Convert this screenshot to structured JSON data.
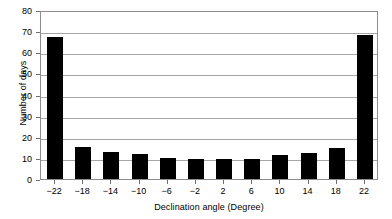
{
  "chart_data": {
    "type": "bar",
    "title": "",
    "subtitle": "",
    "xlabel": "Declination angle (Degree)",
    "ylabel": "Number of days",
    "categories": [
      "−22",
      "−18",
      "−14",
      "−10",
      "−6",
      "−2",
      "2",
      "6",
      "10",
      "14",
      "18",
      "22"
    ],
    "values": [
      67,
      15,
      13,
      12,
      10,
      9.5,
      9.5,
      9.5,
      11.5,
      12.5,
      14.5,
      68
    ],
    "ylim": [
      0,
      80
    ],
    "ytick_labels": [
      "0",
      "10",
      "20",
      "30",
      "40",
      "50",
      "60",
      "70",
      "80"
    ],
    "ytick_values": [
      0,
      10,
      20,
      30,
      40,
      50,
      60,
      70,
      80
    ],
    "grid": true,
    "grid_axis": "y",
    "legend": false,
    "legend_position": "none",
    "bar_color": "#000000",
    "frame_color": "#8d8d8d",
    "grid_color": "#a6a6a6",
    "background": "#ffffff",
    "annotations": []
  }
}
